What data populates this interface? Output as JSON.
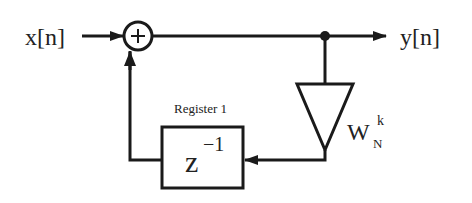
{
  "diagram": {
    "input_label": "x[n]",
    "output_label": "y[n]",
    "adder_symbol": "+",
    "register_label": "Register 1",
    "delay": {
      "base": "z",
      "exponent": "−1"
    },
    "gain": {
      "base": "W",
      "superscript": "k",
      "subscript": "N"
    },
    "colors": {
      "stroke": "#1a1a1a",
      "background": "#ffffff"
    }
  }
}
